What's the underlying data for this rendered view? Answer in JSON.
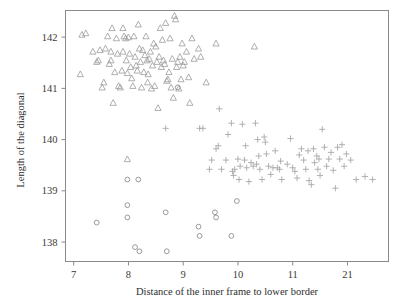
{
  "chart_data": {
    "type": "scatter",
    "title": "",
    "xlabel": "Distance of the inner frame to lower border",
    "ylabel": "Length of the diagonal",
    "xlim": [
      6.85,
      12.75
    ],
    "ylim": [
      137.62,
      142.52
    ],
    "xticks": [
      7,
      8,
      9,
      10,
      11,
      12
    ],
    "xticklabels": [
      "7",
      "8",
      "9",
      "10",
      "11",
      "21"
    ],
    "yticks": [
      138,
      139,
      140,
      141,
      142
    ],
    "yticklabels": [
      "138",
      "139",
      "140",
      "141",
      "142"
    ],
    "grid": false,
    "legend": "none",
    "series": [
      {
        "name": "triangles",
        "marker": "triangle-up",
        "color": "#9a9a9a",
        "points": [
          [
            7.15,
            142.05
          ],
          [
            7.22,
            142.08
          ],
          [
            7.35,
            141.72
          ],
          [
            7.12,
            141.28
          ],
          [
            7.42,
            141.52
          ],
          [
            7.45,
            141.55
          ],
          [
            7.48,
            141.75
          ],
          [
            7.52,
            141.02
          ],
          [
            7.55,
            141.12
          ],
          [
            7.58,
            141.78
          ],
          [
            7.62,
            142.02
          ],
          [
            7.65,
            141.48
          ],
          [
            7.68,
            141.55
          ],
          [
            7.7,
            142.18
          ],
          [
            7.72,
            140.72
          ],
          [
            7.75,
            141.32
          ],
          [
            7.78,
            141.98
          ],
          [
            7.8,
            141.68
          ],
          [
            7.82,
            141.05
          ],
          [
            7.85,
            141.02
          ],
          [
            7.88,
            141.35
          ],
          [
            7.9,
            141.72
          ],
          [
            7.92,
            142.02
          ],
          [
            7.95,
            141.98
          ],
          [
            7.96,
            141.55
          ],
          [
            7.98,
            141.3
          ],
          [
            8.0,
            142.0
          ],
          [
            8.02,
            141.68
          ],
          [
            8.04,
            141.42
          ],
          [
            8.06,
            141.2
          ],
          [
            8.08,
            141.05
          ],
          [
            8.1,
            142.02
          ],
          [
            8.12,
            141.62
          ],
          [
            8.14,
            141.45
          ],
          [
            8.16,
            141.35
          ],
          [
            8.18,
            142.25
          ],
          [
            8.2,
            141.78
          ],
          [
            8.22,
            141.52
          ],
          [
            8.24,
            141.02
          ],
          [
            8.26,
            141.75
          ],
          [
            8.28,
            141.32
          ],
          [
            8.3,
            141.65
          ],
          [
            8.32,
            142.02
          ],
          [
            8.34,
            141.55
          ],
          [
            8.36,
            141.28
          ],
          [
            8.38,
            141.58
          ],
          [
            8.4,
            141.72
          ],
          [
            8.42,
            141.0
          ],
          [
            8.44,
            141.45
          ],
          [
            8.46,
            141.88
          ],
          [
            8.48,
            141.05
          ],
          [
            8.5,
            141.82
          ],
          [
            8.52,
            141.52
          ],
          [
            8.54,
            140.62
          ],
          [
            8.56,
            141.62
          ],
          [
            8.58,
            142.18
          ],
          [
            8.6,
            141.42
          ],
          [
            8.62,
            141.95
          ],
          [
            8.64,
            141.55
          ],
          [
            8.66,
            141.48
          ],
          [
            8.68,
            142.28
          ],
          [
            8.7,
            141.15
          ],
          [
            8.72,
            141.18
          ],
          [
            8.74,
            141.32
          ],
          [
            8.76,
            141.98
          ],
          [
            8.78,
            141.02
          ],
          [
            8.8,
            141.58
          ],
          [
            8.82,
            140.82
          ],
          [
            8.84,
            142.42
          ],
          [
            8.86,
            142.35
          ],
          [
            8.88,
            141.42
          ],
          [
            8.9,
            141.52
          ],
          [
            8.92,
            141.0
          ],
          [
            8.94,
            141.62
          ],
          [
            8.96,
            141.18
          ],
          [
            8.98,
            141.88
          ],
          [
            9.0,
            141.45
          ],
          [
            9.02,
            141.52
          ],
          [
            9.06,
            141.72
          ],
          [
            9.1,
            141.22
          ],
          [
            9.12,
            140.72
          ],
          [
            9.16,
            141.98
          ],
          [
            9.2,
            141.58
          ],
          [
            9.28,
            141.78
          ],
          [
            9.32,
            141.62
          ],
          [
            9.42,
            141.12
          ],
          [
            9.6,
            141.88
          ],
          [
            10.3,
            141.82
          ],
          [
            7.98,
            139.62
          ],
          [
            7.9,
            142.18
          ],
          [
            8.35,
            141.12
          ],
          [
            7.68,
            141.72
          ]
        ]
      },
      {
        "name": "circles",
        "marker": "circle",
        "color": "#8f8f8f",
        "points": [
          [
            7.42,
            138.38
          ],
          [
            7.98,
            139.22
          ],
          [
            8.18,
            139.22
          ],
          [
            7.98,
            138.72
          ],
          [
            7.98,
            138.48
          ],
          [
            8.12,
            137.9
          ],
          [
            8.2,
            137.82
          ],
          [
            8.68,
            138.58
          ],
          [
            8.7,
            137.82
          ],
          [
            9.28,
            138.3
          ],
          [
            9.3,
            138.12
          ],
          [
            9.58,
            138.58
          ],
          [
            9.6,
            138.48
          ],
          [
            9.88,
            138.12
          ],
          [
            9.98,
            138.8
          ],
          [
            8.9,
            141.02
          ]
        ]
      },
      {
        "name": "pluses",
        "marker": "plus",
        "color": "#a8a8a8",
        "points": [
          [
            8.68,
            140.22
          ],
          [
            9.3,
            140.22
          ],
          [
            9.36,
            140.22
          ],
          [
            9.66,
            140.6
          ],
          [
            9.52,
            139.6
          ],
          [
            9.48,
            139.42
          ],
          [
            9.6,
            139.82
          ],
          [
            9.64,
            139.88
          ],
          [
            9.78,
            139.6
          ],
          [
            9.82,
            140.1
          ],
          [
            9.88,
            140.32
          ],
          [
            9.9,
            139.38
          ],
          [
            9.92,
            139.3
          ],
          [
            9.94,
            139.42
          ],
          [
            10.0,
            139.62
          ],
          [
            10.02,
            139.22
          ],
          [
            10.04,
            139.48
          ],
          [
            10.08,
            140.3
          ],
          [
            10.12,
            139.6
          ],
          [
            10.16,
            139.45
          ],
          [
            10.2,
            139.18
          ],
          [
            10.24,
            139.55
          ],
          [
            10.28,
            139.48
          ],
          [
            10.32,
            140.32
          ],
          [
            10.36,
            140.0
          ],
          [
            10.38,
            139.68
          ],
          [
            10.4,
            139.42
          ],
          [
            10.44,
            139.22
          ],
          [
            10.48,
            140.05
          ],
          [
            10.5,
            139.95
          ],
          [
            10.52,
            139.72
          ],
          [
            10.56,
            139.48
          ],
          [
            10.6,
            139.32
          ],
          [
            10.64,
            139.45
          ],
          [
            10.68,
            139.78
          ],
          [
            10.72,
            139.45
          ],
          [
            10.76,
            139.42
          ],
          [
            10.8,
            139.22
          ],
          [
            10.9,
            139.52
          ],
          [
            10.96,
            140.02
          ],
          [
            11.0,
            139.45
          ],
          [
            11.04,
            139.38
          ],
          [
            11.08,
            139.25
          ],
          [
            11.12,
            139.7
          ],
          [
            11.16,
            139.82
          ],
          [
            11.2,
            139.6
          ],
          [
            11.24,
            139.42
          ],
          [
            11.28,
            139.78
          ],
          [
            11.3,
            139.2
          ],
          [
            11.34,
            139.12
          ],
          [
            11.38,
            139.82
          ],
          [
            11.4,
            139.55
          ],
          [
            11.44,
            139.68
          ],
          [
            11.46,
            139.42
          ],
          [
            11.5,
            139.3
          ],
          [
            11.54,
            140.2
          ],
          [
            11.58,
            139.85
          ],
          [
            11.62,
            139.48
          ],
          [
            11.66,
            139.62
          ],
          [
            11.7,
            139.75
          ],
          [
            11.74,
            139.4
          ],
          [
            11.78,
            139.05
          ],
          [
            11.82,
            139.85
          ],
          [
            11.86,
            139.62
          ],
          [
            11.9,
            139.9
          ],
          [
            11.94,
            139.48
          ],
          [
            11.98,
            139.72
          ],
          [
            12.06,
            139.6
          ],
          [
            12.16,
            139.22
          ],
          [
            12.32,
            139.28
          ],
          [
            12.46,
            139.22
          ],
          [
            10.34,
            139.52
          ],
          [
            9.7,
            139.42
          ],
          [
            10.14,
            139.88
          ],
          [
            10.78,
            139.58
          ],
          [
            11.48,
            139.62
          ]
        ]
      }
    ]
  }
}
